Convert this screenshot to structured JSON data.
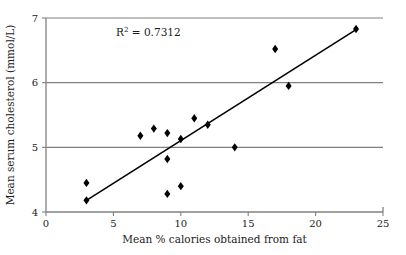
{
  "chart_data": {
    "type": "scatter",
    "title": "",
    "xlabel": "Mean % calories obtained from fat",
    "ylabel": "Mean serum cholesterol (mmol/L)",
    "xlim": [
      0,
      25
    ],
    "ylim": [
      4,
      7
    ],
    "xticks": [
      "0",
      "5",
      "10",
      "15",
      "20",
      "25"
    ],
    "xtick_values": [
      0,
      5,
      10,
      15,
      20,
      25
    ],
    "yticks": [
      "4",
      "5",
      "6",
      "7"
    ],
    "ytick_values": [
      4,
      5,
      6,
      7
    ],
    "grid": "horizontal",
    "gridlines_y": [
      5,
      6,
      7
    ],
    "legend": "none",
    "marker": "diamond",
    "marker_color": "#000000",
    "grid_color": "#808080",
    "axis_color": "#808080",
    "trendline_color": "#000000",
    "points": [
      {
        "x": 3,
        "y": 4.45
      },
      {
        "x": 3,
        "y": 4.18
      },
      {
        "x": 7,
        "y": 5.18
      },
      {
        "x": 8,
        "y": 5.29
      },
      {
        "x": 9,
        "y": 5.22
      },
      {
        "x": 9,
        "y": 4.82
      },
      {
        "x": 9,
        "y": 4.28
      },
      {
        "x": 10,
        "y": 5.13
      },
      {
        "x": 10,
        "y": 4.4
      },
      {
        "x": 11,
        "y": 5.45
      },
      {
        "x": 12,
        "y": 5.35
      },
      {
        "x": 14,
        "y": 5.0
      },
      {
        "x": 17,
        "y": 6.52
      },
      {
        "x": 18,
        "y": 5.95
      },
      {
        "x": 23,
        "y": 6.83
      }
    ],
    "trendline": {
      "x1": 3,
      "y1": 4.18,
      "x2": 23,
      "y2": 6.82
    },
    "annotations": [
      {
        "name": "r-squared",
        "prefix": "R",
        "superscript": "2",
        "suffix": " = 0.7312",
        "text": "R2 = 0.7312",
        "value": 0.7312,
        "x": 5.2,
        "y": 6.72
      }
    ]
  }
}
